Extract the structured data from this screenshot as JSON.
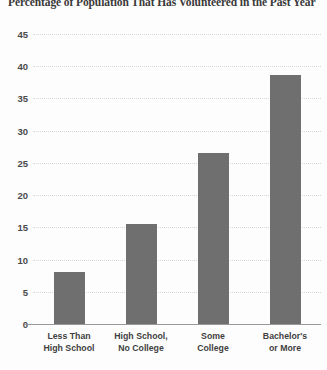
{
  "chart_data": {
    "type": "bar",
    "title": "Percentage of Population That Has Volunteered in the Past Year",
    "xlabel": "",
    "ylabel": "",
    "categories": [
      "Less Than High School",
      "High School, No College",
      "Some College",
      "Bachelor's or More"
    ],
    "category_lines": [
      [
        "Less Than",
        "High School"
      ],
      [
        "High School,",
        "No College"
      ],
      [
        "Some",
        "College"
      ],
      [
        "Bachelor's",
        "or More"
      ]
    ],
    "values": [
      8,
      15.5,
      26.6,
      38.6
    ],
    "ylim": [
      0,
      45
    ],
    "yticks": [
      0,
      5,
      10,
      15,
      20,
      25,
      30,
      35,
      40,
      45
    ],
    "ytick_labels": [
      "0",
      "5",
      "10",
      "15",
      "20",
      "25",
      "30",
      "35",
      "40",
      "45"
    ],
    "grid": true,
    "legend": false,
    "bar_color": "#6f6f6f",
    "grid_color": "#d8d8d8",
    "axis_color": "#9a9a9a",
    "text_color": "#3f3f3f",
    "background": "#fdfdfd"
  }
}
